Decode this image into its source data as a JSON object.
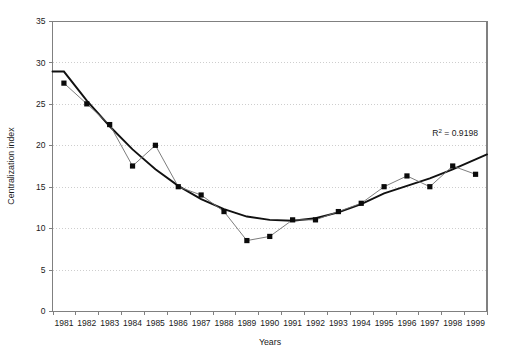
{
  "chart_data": {
    "type": "line",
    "title": "",
    "xlabel": "Years",
    "ylabel": "Centralization index",
    "categories": [
      "1981",
      "1982",
      "1983",
      "1984",
      "1985",
      "1986",
      "1987",
      "1988",
      "1989",
      "1990",
      "1991",
      "1992",
      "1993",
      "1994",
      "1995",
      "1996",
      "1997",
      "1998",
      "1999"
    ],
    "values": [
      27.5,
      25.0,
      22.5,
      17.5,
      20.0,
      15.0,
      14.0,
      12.0,
      8.5,
      9.0,
      11.0,
      11.0,
      12.0,
      13.0,
      15.0,
      16.3,
      15.0,
      17.5,
      16.5
    ],
    "series": [
      {
        "name": "Centralization index",
        "values": [
          27.5,
          25.0,
          22.5,
          17.5,
          20.0,
          15.0,
          14.0,
          12.0,
          8.5,
          9.0,
          11.0,
          11.0,
          12.0,
          13.0,
          15.0,
          16.3,
          15.0,
          17.5,
          16.5
        ]
      },
      {
        "name": "Polynomial trendline",
        "values": [
          28.9,
          25.4,
          22.3,
          19.5,
          17.1,
          15.1,
          13.5,
          12.3,
          11.4,
          11.0,
          10.9,
          11.2,
          11.9,
          12.9,
          14.2,
          15.1,
          16.0,
          17.1,
          18.3
        ]
      }
    ],
    "xlim": [
      1981,
      1999
    ],
    "ylim": [
      0,
      35
    ],
    "yticks": [
      0,
      5,
      10,
      15,
      20,
      25,
      30,
      35
    ],
    "grid": "horizontal-dotted",
    "legend": "none",
    "annotations": [
      {
        "name": "r-squared",
        "text_prefix": "R",
        "text_sup": "2",
        "text_suffix": " = 0.9198",
        "full_text": "R2 = 0.9198",
        "value": 0.9198
      }
    ],
    "colors": {
      "series_line": "#6e6e6e",
      "marker": "#0a0a0a",
      "trend_line": "#111111",
      "grid": "#c9c9c9",
      "axis": "#808080",
      "background": "#ffffff"
    }
  }
}
